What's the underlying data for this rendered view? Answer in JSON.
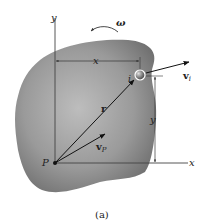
{
  "figure": {
    "caption": "(a)",
    "axes": {
      "x_label": "x",
      "y_label": "y"
    },
    "angular_velocity": {
      "symbol": "ω"
    },
    "dimensions": {
      "horizontal": "x",
      "vertical": "y"
    },
    "vectors": {
      "position": {
        "symbol": "r"
      },
      "velocity_particle": {
        "symbol": "v",
        "subscript": "i"
      },
      "velocity_point": {
        "symbol": "v",
        "subscript": "P"
      }
    },
    "points": {
      "reference": "P",
      "particle": "i"
    },
    "colors": {
      "body_dark": "#6e6e6e",
      "body_light": "#b5b5b5",
      "line": "#333333",
      "arrow": "#111111"
    }
  }
}
